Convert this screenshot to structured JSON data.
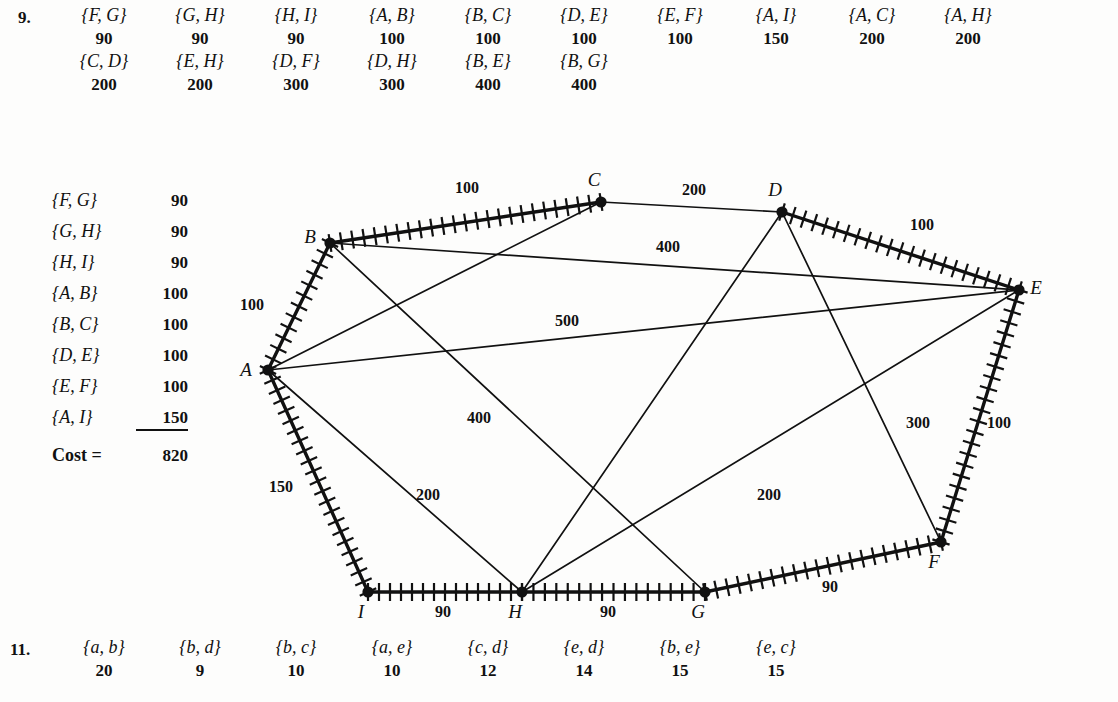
{
  "problem9": {
    "number": "9.",
    "edge_rows": [
      [
        {
          "pair": "{F, G}",
          "weight": "90"
        },
        {
          "pair": "{G, H}",
          "weight": "90"
        },
        {
          "pair": "{H, I}",
          "weight": "90"
        },
        {
          "pair": "{A, B}",
          "weight": "100"
        },
        {
          "pair": "{B, C}",
          "weight": "100"
        },
        {
          "pair": "{D, E}",
          "weight": "100"
        },
        {
          "pair": "{E, F}",
          "weight": "100"
        },
        {
          "pair": "{A, I}",
          "weight": "150"
        },
        {
          "pair": "{A, C}",
          "weight": "200"
        },
        {
          "pair": "{A, H}",
          "weight": "200"
        }
      ],
      [
        {
          "pair": "{C, D}",
          "weight": "200"
        },
        {
          "pair": "{E, H}",
          "weight": "200"
        },
        {
          "pair": "{D, F}",
          "weight": "300"
        },
        {
          "pair": "{D, H}",
          "weight": "300"
        },
        {
          "pair": "{B, E}",
          "weight": "400"
        },
        {
          "pair": "{B, G}",
          "weight": "400"
        }
      ]
    ],
    "tree_list": [
      {
        "pair": "{F, G}",
        "value": "90"
      },
      {
        "pair": "{G, H}",
        "value": "90"
      },
      {
        "pair": "{H, I}",
        "value": "90"
      },
      {
        "pair": "{A, B}",
        "value": "100"
      },
      {
        "pair": "{B, C}",
        "value": "100"
      },
      {
        "pair": "{D, E}",
        "value": "100"
      },
      {
        "pair": "{E, F}",
        "value": "100"
      },
      {
        "pair": "{A, I}",
        "value": "150"
      }
    ],
    "cost_label": "Cost =",
    "cost_value": "820"
  },
  "problem11": {
    "number": "11.",
    "edges": [
      {
        "pair": "{a, b}",
        "weight": "20"
      },
      {
        "pair": "{b, d}",
        "weight": "9"
      },
      {
        "pair": "{b, c}",
        "weight": "10"
      },
      {
        "pair": "{a, e}",
        "weight": "10"
      },
      {
        "pair": "{c, d}",
        "weight": "12"
      },
      {
        "pair": "{e, d}",
        "weight": "14"
      },
      {
        "pair": "{b, e}",
        "weight": "15"
      },
      {
        "pair": "{e, c}",
        "weight": "15"
      }
    ]
  },
  "graph": {
    "nodes": [
      {
        "id": "A",
        "label": "A",
        "x": 268,
        "y": 210,
        "lx": 246,
        "ly": 216
      },
      {
        "id": "B",
        "label": "B",
        "x": 330,
        "y": 83,
        "lx": 310,
        "ly": 83
      },
      {
        "id": "C",
        "label": "C",
        "x": 601,
        "y": 42,
        "lx": 594,
        "ly": 26
      },
      {
        "id": "D",
        "label": "D",
        "x": 782,
        "y": 52,
        "lx": 775,
        "ly": 36
      },
      {
        "id": "E",
        "label": "E",
        "x": 1019,
        "y": 130,
        "lx": 1036,
        "ly": 134
      },
      {
        "id": "F",
        "label": "F",
        "x": 941,
        "y": 382,
        "lx": 934,
        "ly": 408
      },
      {
        "id": "G",
        "label": "G",
        "x": 705,
        "y": 432,
        "lx": 698,
        "ly": 458
      },
      {
        "id": "H",
        "label": "H",
        "x": 522,
        "y": 432,
        "lx": 515,
        "ly": 458
      },
      {
        "id": "I",
        "label": "I",
        "x": 368,
        "y": 432,
        "lx": 361,
        "ly": 458
      }
    ],
    "edges": [
      {
        "from": "A",
        "to": "B",
        "weight": "100",
        "tree": true,
        "lx": 252,
        "ly": 150
      },
      {
        "from": "B",
        "to": "C",
        "weight": "100",
        "tree": true,
        "lx": 467,
        "ly": 33
      },
      {
        "from": "C",
        "to": "D",
        "weight": "200",
        "tree": false,
        "lx": 694,
        "ly": 35
      },
      {
        "from": "D",
        "to": "E",
        "weight": "100",
        "tree": true,
        "lx": 922,
        "ly": 70
      },
      {
        "from": "E",
        "to": "F",
        "weight": "100",
        "tree": true,
        "lx": 999,
        "ly": 268
      },
      {
        "from": "F",
        "to": "G",
        "weight": "90",
        "tree": true,
        "lx": 830,
        "ly": 432
      },
      {
        "from": "G",
        "to": "H",
        "weight": "90",
        "tree": true,
        "lx": 608,
        "ly": 457
      },
      {
        "from": "H",
        "to": "I",
        "weight": "90",
        "tree": true,
        "lx": 443,
        "ly": 457
      },
      {
        "from": "I",
        "to": "A",
        "weight": "150",
        "tree": true,
        "lx": 281,
        "ly": 332
      },
      {
        "from": "A",
        "to": "C",
        "weight": "200",
        "tree": false,
        "lx": null,
        "ly": null
      },
      {
        "from": "B",
        "to": "E",
        "weight": "400",
        "tree": false,
        "lx": 668,
        "ly": 92
      },
      {
        "from": "A",
        "to": "E",
        "weight": "500",
        "tree": false,
        "lx": 567,
        "ly": 166
      },
      {
        "from": "A",
        "to": "H",
        "weight": "200",
        "tree": false,
        "lx": 428,
        "ly": 340
      },
      {
        "from": "B",
        "to": "G",
        "weight": "400",
        "tree": false,
        "lx": 479,
        "ly": 263
      },
      {
        "from": "D",
        "to": "H",
        "weight": "300",
        "tree": false,
        "lx": null,
        "ly": null
      },
      {
        "from": "D",
        "to": "F",
        "weight": "300",
        "tree": false,
        "lx": 918,
        "ly": 268
      },
      {
        "from": "E",
        "to": "H",
        "weight": "200",
        "tree": false,
        "lx": 769,
        "ly": 340
      }
    ]
  }
}
